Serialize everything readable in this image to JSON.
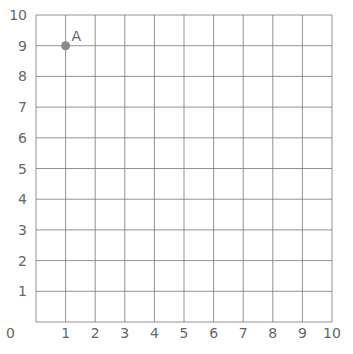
{
  "chart_data": {
    "type": "scatter",
    "title": "",
    "xlabel": "",
    "ylabel": "",
    "xlim": [
      0,
      10
    ],
    "ylim": [
      0,
      10
    ],
    "grid": true,
    "x_ticks": [
      "1",
      "2",
      "3",
      "4",
      "5",
      "6",
      "7",
      "8",
      "9",
      "10"
    ],
    "y_ticks": [
      "1",
      "2",
      "3",
      "4",
      "5",
      "6",
      "7",
      "8",
      "9",
      "10"
    ],
    "origin_label": "0",
    "points": [
      {
        "label": "A",
        "x": 1,
        "y": 9
      }
    ]
  },
  "colors": {
    "grid": "#777777",
    "point": "#8a8a8a",
    "text": "#666666"
  }
}
